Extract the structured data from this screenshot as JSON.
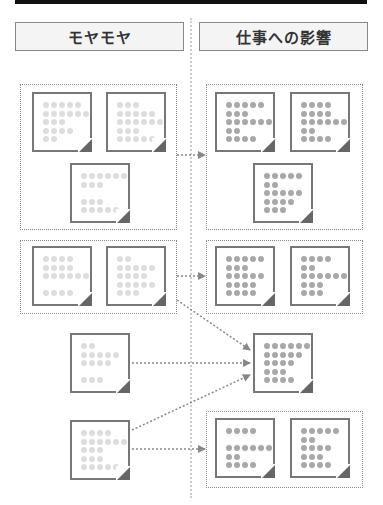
{
  "headers": {
    "left": "モヤモヤ",
    "right": "仕事への影響"
  },
  "colors": {
    "header_border": "#888888",
    "header_bg": "#f4f4f4",
    "note_border": "#777777",
    "dot_light": "#dddddd",
    "dot_dark": "#a8a8a8",
    "arrow": "#888888"
  },
  "left_column_label": "モヤモヤ",
  "right_column_label": "仕事への影響",
  "notes": {
    "g1_left_a": [
      5,
      6,
      3,
      4,
      2
    ],
    "g1_left_b": [
      3,
      5,
      6,
      3,
      5
    ],
    "g1_left_c": [
      6,
      3,
      0,
      3,
      5
    ],
    "g1_right_a": [
      5,
      3,
      6,
      2,
      4
    ],
    "g1_right_b": [
      4,
      4,
      6,
      2,
      4
    ],
    "g1_right_c": [
      5,
      2,
      5,
      4,
      3
    ],
    "g2_left_a": [
      4,
      4,
      6,
      0,
      4
    ],
    "g2_left_b": [
      2,
      5,
      4,
      5,
      3
    ],
    "g2_right_a": [
      5,
      3,
      5,
      4,
      4
    ],
    "g2_right_b": [
      4,
      2,
      6,
      3,
      3
    ],
    "r3_left": [
      2,
      5,
      4,
      0,
      3
    ],
    "r3_right": [
      6,
      5,
      4,
      3,
      4
    ],
    "r4_left": [
      4,
      6,
      3,
      3,
      5
    ],
    "r4_right_a": [
      4,
      0,
      6,
      2,
      4
    ],
    "r4_right_b": [
      5,
      2,
      4,
      3,
      4
    ]
  }
}
